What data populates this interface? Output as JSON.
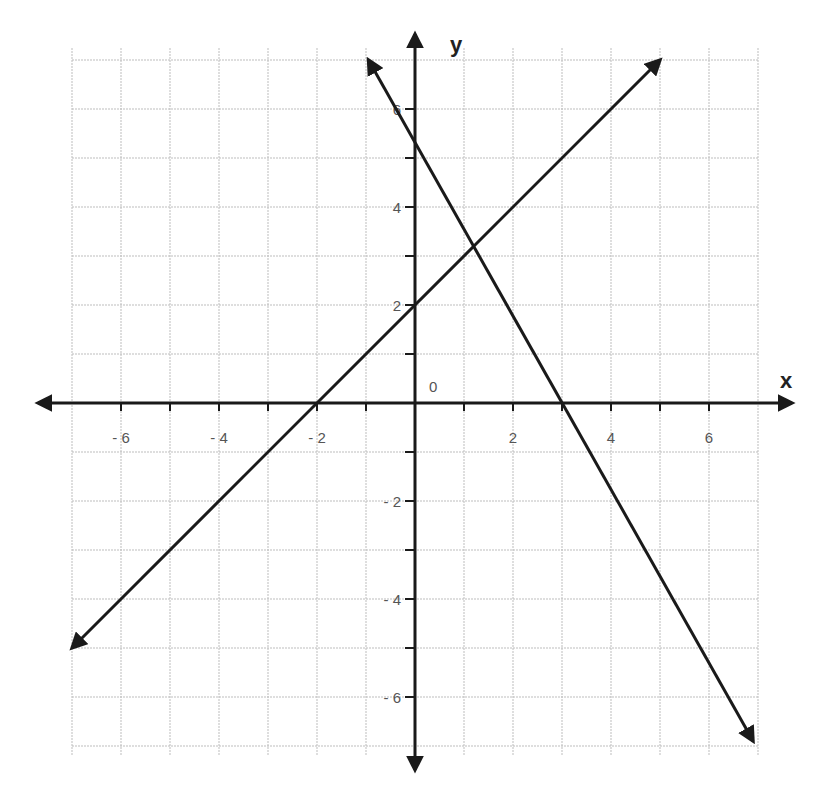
{
  "chart_data": {
    "type": "line",
    "title": "",
    "xlabel": "x",
    "ylabel": "y",
    "origin_label": "0",
    "xlim": [
      -7,
      7
    ],
    "ylim": [
      -7,
      7
    ],
    "grid": true,
    "x_ticks": [
      -6,
      -4,
      -2,
      2,
      4,
      6
    ],
    "y_ticks": [
      -6,
      -4,
      -2,
      2,
      4,
      6
    ],
    "x_tick_labels": [
      "- 6",
      "- 4",
      "- 2",
      "2",
      "4",
      "6"
    ],
    "y_tick_labels": [
      "- 6",
      "- 4",
      "- 2",
      "2",
      "4",
      "6"
    ],
    "series": [
      {
        "name": "line-increasing",
        "equation": "y = x + 2",
        "x": [
          -7,
          5
        ],
        "y": [
          -5,
          7
        ],
        "x_intercept": -2,
        "y_intercept": 2,
        "arrows": "both"
      },
      {
        "name": "line-decreasing",
        "equation": "y ≈ -1.77x + 5.3",
        "x": [
          -0.95,
          6.9
        ],
        "y": [
          7,
          -6.9
        ],
        "x_intercept": 3,
        "y_intercept": 5.3,
        "arrows": "both"
      }
    ],
    "intersection": {
      "x": 1.2,
      "y": 3.2
    }
  },
  "colors": {
    "grid": "#bdbdbd",
    "axis": "#1a1a1a",
    "line": "#1a1a1a",
    "tick_label": "#555555"
  }
}
